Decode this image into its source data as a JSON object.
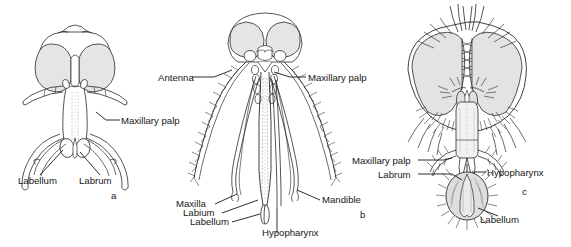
{
  "figure": {
    "background_color": "#ffffff",
    "line_color": "#2a2a2a",
    "eye_fill_color": "#e2e2e2",
    "labellum_fill_color": "#dcdcdc",
    "panels": [
      {
        "id": "a",
        "letter": "a",
        "name": "biting-midge-head",
        "labels": [
          {
            "name": "maxillary-palp",
            "text": "Maxillary palp"
          },
          {
            "name": "labellum",
            "text": "Labellum"
          },
          {
            "name": "labrum",
            "text": "Labrum"
          }
        ]
      },
      {
        "id": "b",
        "letter": "b",
        "name": "mosquito-head",
        "labels": [
          {
            "name": "antenna",
            "text": "Antenna"
          },
          {
            "name": "maxillary-palp",
            "text": "Maxillary palp"
          },
          {
            "name": "maxilla",
            "text": "Maxilla"
          },
          {
            "name": "labium",
            "text": "Labium"
          },
          {
            "name": "labellum",
            "text": "Labellum"
          },
          {
            "name": "hypopharynx",
            "text": "Hypopharynx"
          },
          {
            "name": "mandible",
            "text": "Mandible"
          }
        ]
      },
      {
        "id": "c",
        "letter": "c",
        "name": "housefly-head",
        "labels": [
          {
            "name": "maxillary-palp",
            "text": "Maxillary palp"
          },
          {
            "name": "labrum",
            "text": "Labrum"
          },
          {
            "name": "hypopharynx",
            "text": "Hypopharynx"
          },
          {
            "name": "labellum",
            "text": "Labellum"
          }
        ]
      }
    ]
  }
}
